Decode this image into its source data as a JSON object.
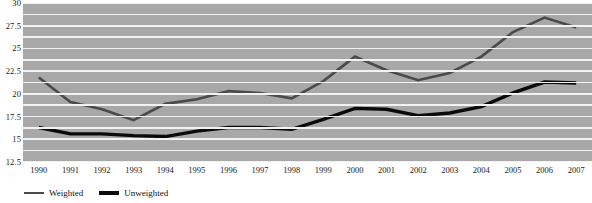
{
  "chart_data": {
    "type": "line",
    "title": "",
    "subtitle": "",
    "xlabel": "",
    "ylabel": "",
    "x": [
      "1990",
      "1991",
      "1992",
      "1993",
      "1994",
      "1995",
      "1996",
      "1997",
      "1998",
      "1999",
      "2000",
      "2001",
      "2002",
      "2003",
      "2004",
      "2005",
      "2006",
      "2007"
    ],
    "xlim": [
      "1990",
      "2007"
    ],
    "ylim": [
      12.5,
      30
    ],
    "y_ticks": [
      12.5,
      15,
      17.5,
      20,
      22.5,
      25,
      27.5,
      30
    ],
    "y_tick_labels": [
      "12.5",
      "15",
      "17.5",
      "20",
      "22.5",
      "25",
      "27.5",
      "30"
    ],
    "gridlines": {
      "axis": "y",
      "visible": true,
      "step": 1.25,
      "values": [
        12.5,
        13.75,
        15,
        16.25,
        17.5,
        18.75,
        20,
        21.25,
        22.5,
        23.75,
        25,
        26.25,
        27.5,
        28.75,
        30
      ],
      "color": "#f2f2f2"
    },
    "plot_background": "#a8a8a8",
    "legend": {
      "position": "below-axis-left",
      "entries": [
        {
          "name": "Weighted",
          "color": "#4a4a4a"
        },
        {
          "name": "Unweighted",
          "color": "#0a0a0a"
        }
      ]
    },
    "series": [
      {
        "name": "Weighted",
        "color": "#4a4a4a",
        "line_width": 2.6,
        "values": [
          21.8,
          19.1,
          18.3,
          17.1,
          18.9,
          19.4,
          20.3,
          20.1,
          19.5,
          21.4,
          24.1,
          22.6,
          21.5,
          22.3,
          24.1,
          26.8,
          28.4,
          27.3
        ]
      },
      {
        "name": "Unweighted",
        "color": "#0a0a0a",
        "line_width": 3.4,
        "values": [
          16.3,
          15.6,
          15.6,
          15.4,
          15.3,
          15.9,
          16.3,
          16.3,
          16.1,
          17.2,
          18.4,
          18.3,
          17.6,
          17.9,
          18.6,
          20.1,
          21.3,
          21.2
        ]
      }
    ]
  }
}
